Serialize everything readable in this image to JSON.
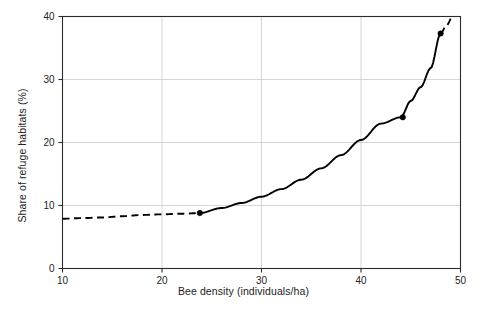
{
  "chart_data": {
    "type": "line",
    "title": "",
    "xlabel": "Bee density (individuals/ha)",
    "ylabel": "Share of refuge habitats (%)",
    "xlim": [
      10,
      50
    ],
    "ylim": [
      0,
      40
    ],
    "xticks": [
      10,
      20,
      30,
      40,
      50
    ],
    "yticks": [
      0,
      10,
      20,
      30,
      40
    ],
    "xtick_labels": [
      "10",
      "20",
      "30",
      "40",
      "50"
    ],
    "ytick_labels": [
      "0",
      "10",
      "20",
      "30",
      "40"
    ],
    "grid": true,
    "grid_color": "#cccccc",
    "legend": null,
    "line_color": "#000000",
    "series": [
      {
        "name": "Share of refuge habitats",
        "style": "solid-with-dashed-extrapolation",
        "solid_range": [
          23.8,
          48.0
        ],
        "dashed_ranges": [
          [
            10.0,
            23.8
          ],
          [
            48.0,
            49.2
          ]
        ],
        "x": [
          10,
          12,
          14,
          16,
          18,
          20,
          22,
          23.8,
          26,
          28,
          30,
          32,
          34,
          36,
          38,
          40,
          42,
          44,
          45,
          46,
          47,
          48,
          48.6,
          49.2
        ],
        "y": [
          7.9,
          8.0,
          8.1,
          8.3,
          8.5,
          8.6,
          8.7,
          8.8,
          9.6,
          10.4,
          11.4,
          12.6,
          14.1,
          15.9,
          18.0,
          20.4,
          23.0,
          24.0,
          26.6,
          28.8,
          31.8,
          37.3,
          38.6,
          40.0
        ]
      }
    ],
    "markers": [
      {
        "x": 23.8,
        "y": 8.8
      },
      {
        "x": 44.2,
        "y": 24.0
      },
      {
        "x": 48.0,
        "y": 37.3
      }
    ]
  }
}
